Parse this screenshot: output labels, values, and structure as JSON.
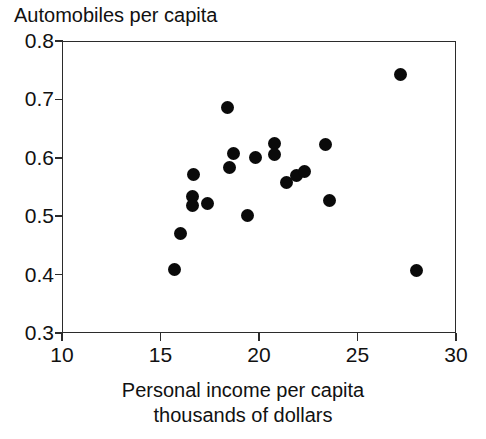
{
  "chart_data": {
    "type": "scatter",
    "title": "",
    "ylabel": "Automobiles per capita",
    "xlabel": "Personal income per capita",
    "xlabel_line2": "thousands of dollars",
    "xlim": [
      10,
      30
    ],
    "ylim": [
      0.3,
      0.8
    ],
    "xticks": [
      "10",
      "15",
      "20",
      "25",
      "30"
    ],
    "xtick_values": [
      10,
      15,
      20,
      25,
      30
    ],
    "yticks": [
      "0.8",
      "0.7",
      "0.6",
      "0.5",
      "0.4",
      "0.3"
    ],
    "ytick_values": [
      0.8,
      0.7,
      0.6,
      0.5,
      0.4,
      0.3
    ],
    "grid": false,
    "legend": "none",
    "marker": "filled-circle",
    "marker_color": "#0a0a0a",
    "axis_color": "#2b2b2b",
    "background": "#ffffff",
    "points": [
      {
        "x": 15.7,
        "y": 0.408
      },
      {
        "x": 16.0,
        "y": 0.471
      },
      {
        "x": 16.6,
        "y": 0.533
      },
      {
        "x": 16.6,
        "y": 0.519
      },
      {
        "x": 16.7,
        "y": 0.572
      },
      {
        "x": 17.4,
        "y": 0.522
      },
      {
        "x": 18.4,
        "y": 0.686
      },
      {
        "x": 18.5,
        "y": 0.583
      },
      {
        "x": 18.7,
        "y": 0.607
      },
      {
        "x": 19.4,
        "y": 0.501
      },
      {
        "x": 19.8,
        "y": 0.601
      },
      {
        "x": 20.8,
        "y": 0.625
      },
      {
        "x": 20.8,
        "y": 0.605
      },
      {
        "x": 21.4,
        "y": 0.558
      },
      {
        "x": 21.9,
        "y": 0.569
      },
      {
        "x": 22.3,
        "y": 0.577
      },
      {
        "x": 23.4,
        "y": 0.623
      },
      {
        "x": 23.6,
        "y": 0.527
      },
      {
        "x": 27.2,
        "y": 0.743
      },
      {
        "x": 28.0,
        "y": 0.407
      }
    ]
  }
}
